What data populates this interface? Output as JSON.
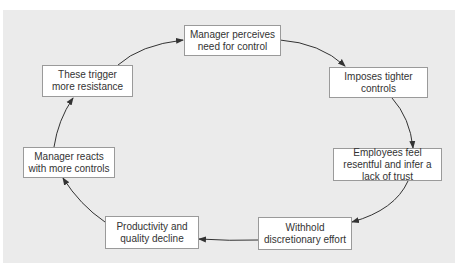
{
  "diagram": {
    "type": "cycle",
    "background_color": "#ebebeb",
    "box_border_color": "#9a9a9a",
    "arrow_color": "#333333",
    "nodes": [
      {
        "id": "n1",
        "label": "Manager perceives need for control"
      },
      {
        "id": "n2",
        "label": "Imposes tighter controls"
      },
      {
        "id": "n3",
        "label": "Employees feel resentful and infer a lack of trust"
      },
      {
        "id": "n4",
        "label": "Withhold discretionary effort"
      },
      {
        "id": "n5",
        "label": "Productivity and quality decline"
      },
      {
        "id": "n6",
        "label": "Manager reacts with more controls"
      },
      {
        "id": "n7",
        "label": "These trigger more resistance"
      }
    ],
    "edges": [
      {
        "from": "n1",
        "to": "n2"
      },
      {
        "from": "n2",
        "to": "n3"
      },
      {
        "from": "n3",
        "to": "n4"
      },
      {
        "from": "n4",
        "to": "n5"
      },
      {
        "from": "n5",
        "to": "n6"
      },
      {
        "from": "n6",
        "to": "n7"
      },
      {
        "from": "n7",
        "to": "n1"
      }
    ]
  }
}
